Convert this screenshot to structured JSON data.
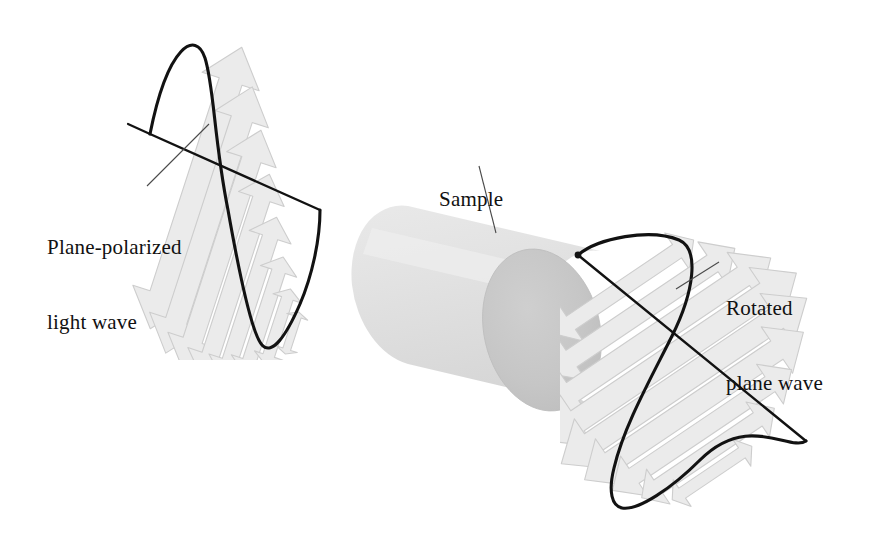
{
  "figure": {
    "title_visible": false,
    "background_color": "#ffffff"
  },
  "labels": {
    "incoming": {
      "line1": "Plane-polarized",
      "line2": "light wave"
    },
    "sample": "Sample",
    "outgoing": {
      "line1": "Rotated",
      "line2": "plane wave"
    }
  },
  "colors": {
    "ink": "#111111",
    "leader_line": "#4a4a4a",
    "wave_curve": "#121212",
    "ray_axis": "#121212",
    "arrow_fill": "#ebebeb",
    "arrow_stroke": "#c9c9c9",
    "cylinder_body_light": "#e6e6e6",
    "cylinder_body_mid": "#dcdcdc",
    "cylinder_cap": "#c6c6c6",
    "cylinder_cap_edge": "#bdbdbd",
    "exit_dot": "#141414"
  },
  "geometry": {
    "canvas": {
      "width": 878,
      "height": 543
    },
    "ray": {
      "entry_point": [
        320,
        210
      ],
      "exit_point": [
        578,
        255
      ],
      "left_stub_start": [
        128,
        124
      ],
      "left_stub_end": [
        150,
        134
      ],
      "right_end": [
        806,
        441
      ]
    },
    "cylinder": {
      "axis_start": [
        352,
        285
      ],
      "axis_end": [
        545,
        330
      ],
      "radius_x": 58,
      "radius_y": 82,
      "cap_center": [
        542,
        330
      ]
    },
    "incoming_wave": {
      "amplitude_px": 150,
      "arrow_count": 9,
      "polarization_angle_deg": -72,
      "curve_top": [
        196,
        36
      ],
      "curve_bottom": [
        262,
        346
      ]
    },
    "outgoing_wave": {
      "amplitude_px": 150,
      "arrow_count": 9,
      "polarization_angle_deg": -34,
      "curve_top": [
        679,
        238
      ],
      "curve_bottom": [
        616,
        505
      ]
    }
  },
  "leaders": {
    "incoming": {
      "from": [
        147,
        186
      ],
      "to": [
        209,
        124
      ]
    },
    "sample": {
      "from": [
        479,
        166
      ],
      "to": [
        496,
        233
      ]
    },
    "outgoing": {
      "from": [
        719,
        262
      ],
      "to": [
        676,
        289
      ]
    }
  }
}
